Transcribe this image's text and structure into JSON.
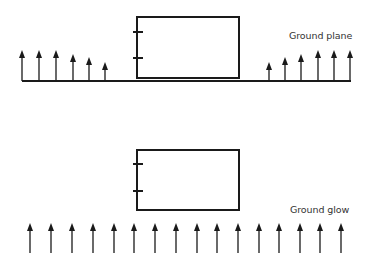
{
  "diagram": {
    "colors": {
      "stroke": "#1a1a1a",
      "text": "#333333",
      "background": "#ffffff"
    },
    "panels": [
      {
        "id": "ground-plane",
        "label": "Ground plane",
        "label_pos": {
          "x": 289,
          "y": 30
        },
        "box": {
          "x": 137,
          "y": 17,
          "w": 102,
          "h": 61,
          "ticks_y": [
            32,
            58
          ]
        },
        "ground_line": {
          "x1": 22,
          "x2": 351,
          "y": 81
        },
        "arrows": [
          {
            "x": 22,
            "y1": 81,
            "y2": 50
          },
          {
            "x": 39,
            "y1": 81,
            "y2": 50
          },
          {
            "x": 56,
            "y1": 81,
            "y2": 50
          },
          {
            "x": 73,
            "y1": 81,
            "y2": 54
          },
          {
            "x": 89,
            "y1": 81,
            "y2": 57
          },
          {
            "x": 105,
            "y1": 81,
            "y2": 62
          },
          {
            "x": 269,
            "y1": 81,
            "y2": 62
          },
          {
            "x": 285,
            "y1": 81,
            "y2": 57
          },
          {
            "x": 301,
            "y1": 81,
            "y2": 54
          },
          {
            "x": 318,
            "y1": 81,
            "y2": 50
          },
          {
            "x": 334,
            "y1": 81,
            "y2": 50
          },
          {
            "x": 350,
            "y1": 81,
            "y2": 50
          }
        ]
      },
      {
        "id": "ground-glow",
        "label": "Ground glow",
        "label_pos": {
          "x": 290,
          "y": 204
        },
        "box": {
          "x": 137,
          "y": 150,
          "w": 102,
          "h": 60,
          "ticks_y": [
            164,
            191
          ]
        },
        "ground_line": null,
        "arrows": [
          {
            "x": 30,
            "y1": 253,
            "y2": 223
          },
          {
            "x": 51,
            "y1": 253,
            "y2": 223
          },
          {
            "x": 72,
            "y1": 253,
            "y2": 223
          },
          {
            "x": 93,
            "y1": 253,
            "y2": 223
          },
          {
            "x": 114,
            "y1": 253,
            "y2": 223
          },
          {
            "x": 134,
            "y1": 253,
            "y2": 223
          },
          {
            "x": 155,
            "y1": 253,
            "y2": 223
          },
          {
            "x": 176,
            "y1": 253,
            "y2": 223
          },
          {
            "x": 197,
            "y1": 253,
            "y2": 223
          },
          {
            "x": 217,
            "y1": 253,
            "y2": 223
          },
          {
            "x": 238,
            "y1": 253,
            "y2": 223
          },
          {
            "x": 259,
            "y1": 253,
            "y2": 223
          },
          {
            "x": 279,
            "y1": 253,
            "y2": 223
          },
          {
            "x": 300,
            "y1": 253,
            "y2": 223
          },
          {
            "x": 320,
            "y1": 253,
            "y2": 223
          },
          {
            "x": 341,
            "y1": 253,
            "y2": 223
          }
        ]
      }
    ]
  }
}
